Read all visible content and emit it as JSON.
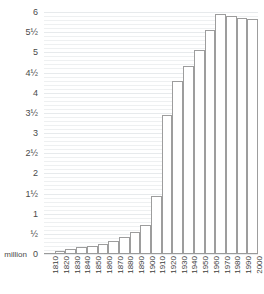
{
  "chart_data": {
    "type": "bar",
    "title": "",
    "xlabel": "",
    "ylabel": "million",
    "unit_label": "million",
    "ylim": [
      0,
      6
    ],
    "grid": true,
    "grid_major_step": 0.5,
    "grid_minor_step": 0.1,
    "legend": "none",
    "axis_color": "#9a9a9a",
    "bar_edge_color": "#9d9d9d",
    "bar_fill_color": "#ffffff",
    "gridline_color": "#eef0f1",
    "text_color": "#444444",
    "ytick_labels": [
      "6",
      "5½",
      "5",
      "4½",
      "4",
      "3½",
      "3",
      "2½",
      "2",
      "1½",
      "1",
      "½",
      "0"
    ],
    "ytick_values": [
      6,
      5.5,
      5,
      4.5,
      4,
      3.5,
      3,
      2.5,
      2,
      1.5,
      1,
      0.5,
      0
    ],
    "categories": [
      "1810",
      "1820",
      "1830",
      "1840",
      "1850",
      "1860",
      "1870",
      "1880",
      "1890",
      "1900",
      "1910",
      "1920",
      "1930",
      "1940",
      "1950",
      "1960",
      "1970",
      "1980",
      "1990",
      "2000"
    ],
    "values": [
      0.03,
      0.08,
      0.13,
      0.17,
      0.21,
      0.26,
      0.33,
      0.42,
      0.55,
      0.72,
      1.45,
      3.45,
      4.3,
      4.65,
      5.05,
      5.55,
      5.95,
      5.9,
      5.85,
      5.83
    ]
  }
}
